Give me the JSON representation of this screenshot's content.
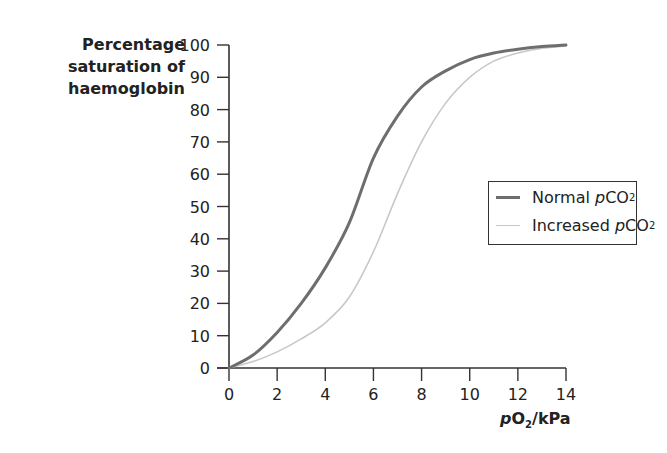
{
  "chart_data": {
    "type": "line",
    "title": "",
    "ylabel_lines": [
      "Percentage",
      "saturation of",
      "haemoglobin"
    ],
    "ylabel": "Percentage saturation of haemoglobin",
    "xlabel": "pO2/kPa",
    "xlabel_parts": {
      "italic_p": "p",
      "O": "O",
      "sub": "2",
      "rest": "/kPa"
    },
    "xlim": [
      0,
      14
    ],
    "ylim": [
      0,
      100
    ],
    "xticks": [
      0,
      2,
      4,
      6,
      8,
      10,
      12,
      14
    ],
    "yticks": [
      0,
      10,
      20,
      30,
      40,
      50,
      60,
      70,
      80,
      90,
      100
    ],
    "grid": false,
    "legend_position": "right-middle",
    "x": [
      0,
      1,
      2,
      3,
      4,
      5,
      6,
      7,
      8,
      9,
      10,
      11,
      12,
      13,
      14
    ],
    "series": [
      {
        "name": "Normal pCO2",
        "legend": {
          "prefix": "Normal ",
          "p": "p",
          "co": "CO",
          "sub": "2"
        },
        "color": "#6e6e6e",
        "width": 3,
        "values": [
          0,
          4,
          11,
          20,
          31,
          45,
          65,
          78,
          87,
          92,
          95.5,
          97.5,
          98.7,
          99.5,
          100
        ]
      },
      {
        "name": "Increased pCO2",
        "legend": {
          "prefix": "Increased ",
          "p": "p",
          "co": "CO",
          "sub": "2"
        },
        "color": "#c8c8c8",
        "width": 1.6,
        "values": [
          0,
          2,
          5,
          9,
          14,
          22,
          36,
          54,
          70,
          82,
          90,
          95,
          97.5,
          99,
          99.7
        ]
      }
    ]
  }
}
